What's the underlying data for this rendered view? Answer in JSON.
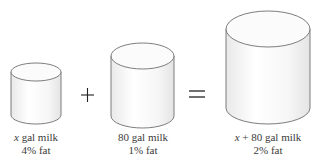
{
  "diagram": {
    "type": "mixture-problem",
    "operators": {
      "plus": "+",
      "equals": "="
    },
    "containers": [
      {
        "id": "milk-a",
        "quantity_var": "x",
        "quantity_rest": " gal milk",
        "fat": "4% fat"
      },
      {
        "id": "milk-b",
        "quantity_var": "",
        "quantity_rest": "80 gal milk",
        "fat": "1% fat"
      },
      {
        "id": "mixture",
        "quantity_var": "x",
        "quantity_rest": " + 80 gal milk",
        "fat": "2% fat"
      }
    ],
    "colors": {
      "stroke": "#6e6e6e",
      "fill": "#f7f7f7",
      "highlight": "#ffffff"
    }
  }
}
